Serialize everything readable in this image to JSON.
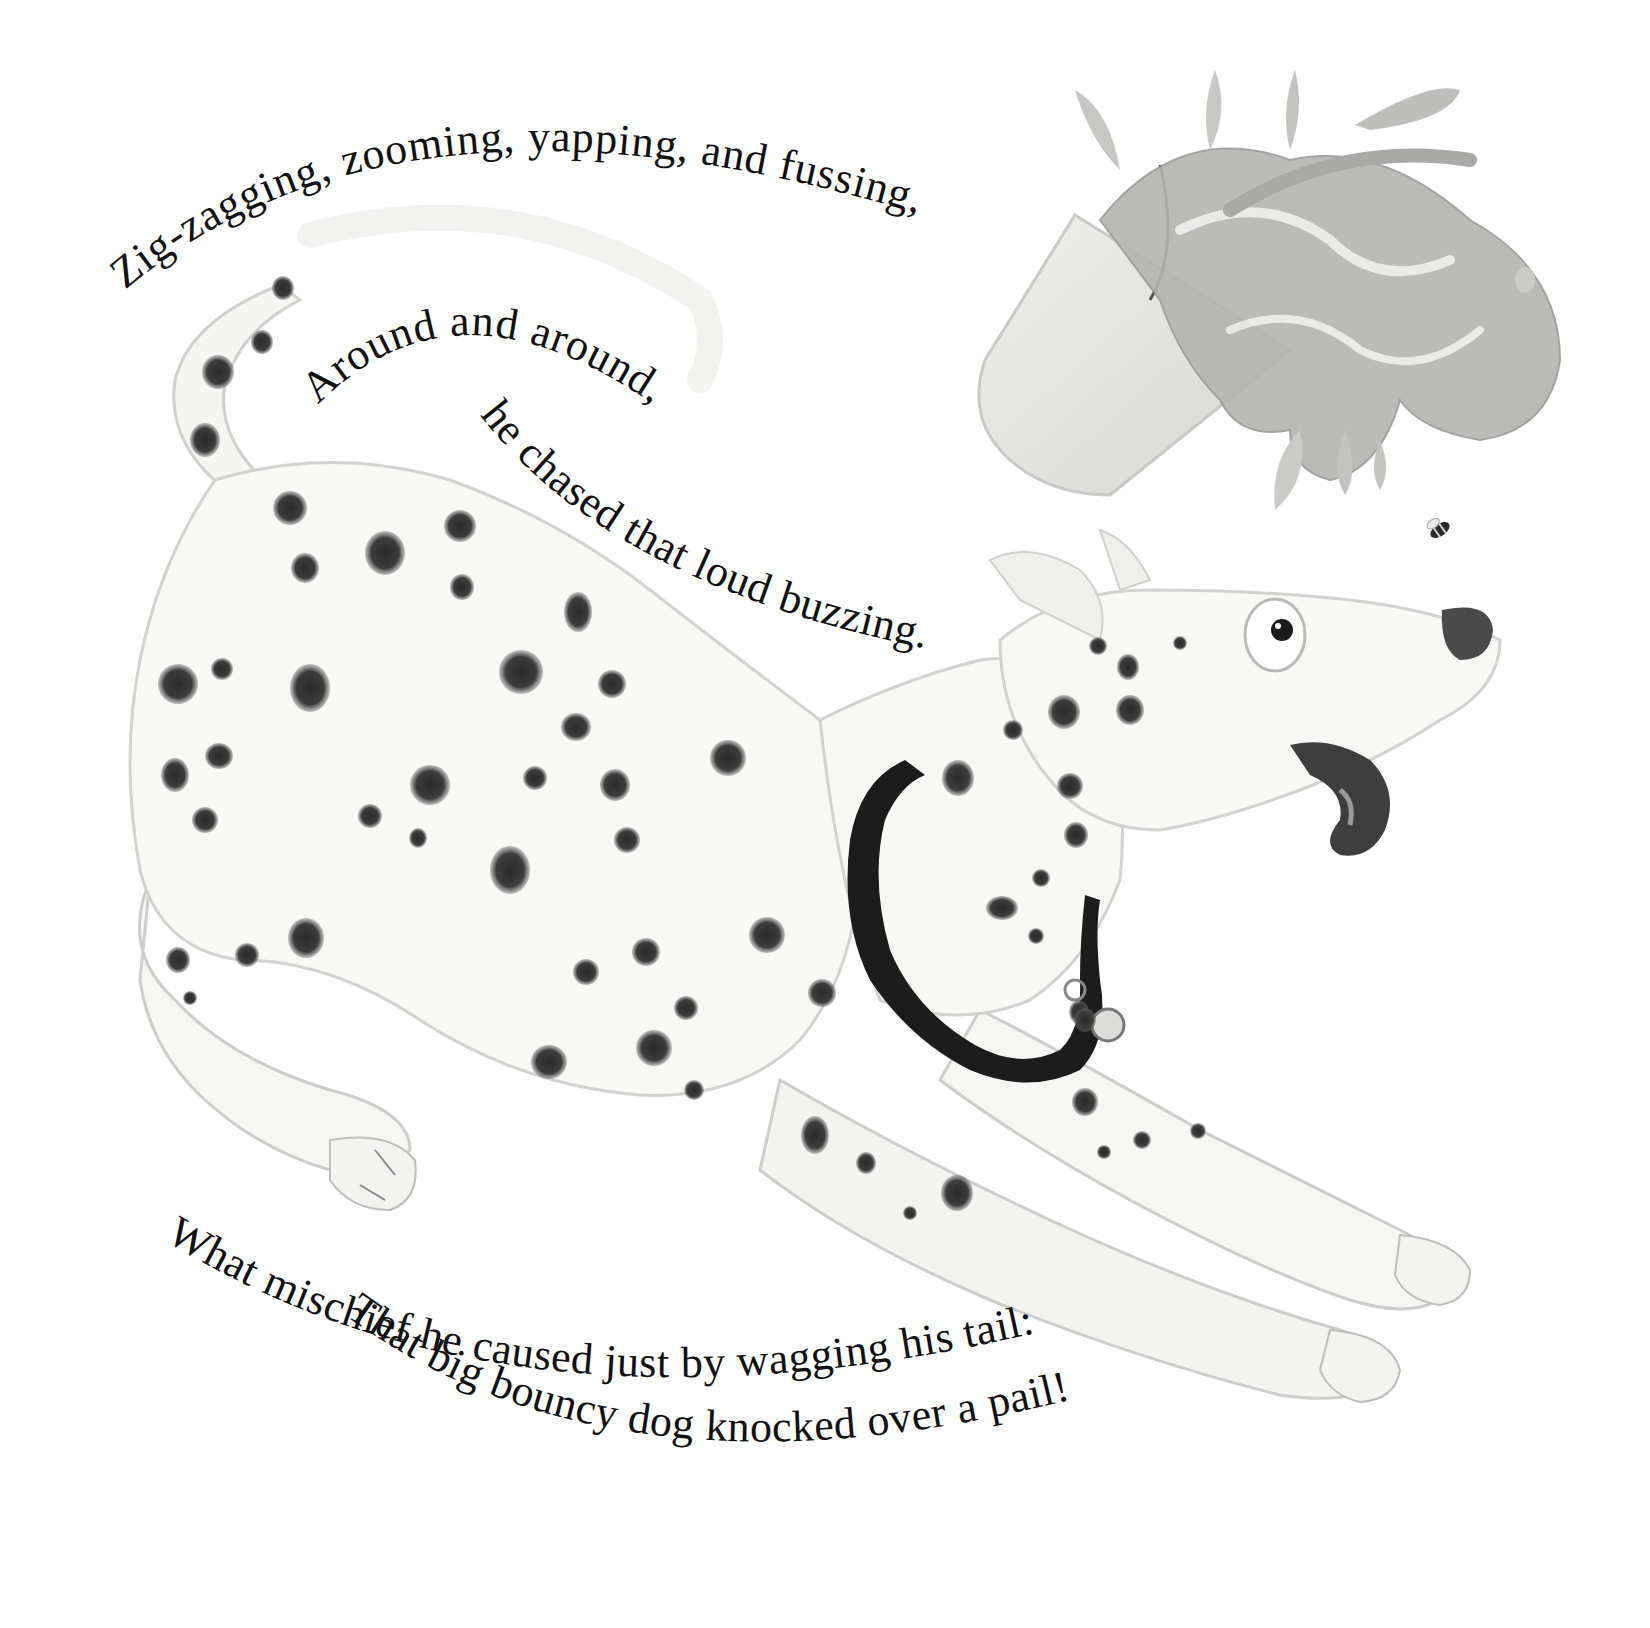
{
  "page": {
    "type": "picture-book-page",
    "background": "#ffffff"
  },
  "verse": {
    "line1": "Zig-zagging, zooming, yapping, and fussing,",
    "line2": "Around and around,",
    "line3": "he chased that loud buzzing.",
    "line4": "What mischief he caused just by wagging his tail:",
    "line5": "That big bouncy dog knocked over a pail!"
  },
  "illustration": {
    "subject": "dalmatian-dog",
    "objects": [
      "tipped-pail",
      "paint-splash",
      "bee"
    ],
    "colors": {
      "dog_body": "#f7f7f5",
      "spots": "#3a3a3a",
      "collar": "#1c1c1c",
      "pail": "#e4e4e2",
      "splash": "#a9a9a7",
      "outline": "#cfcfcd"
    }
  }
}
